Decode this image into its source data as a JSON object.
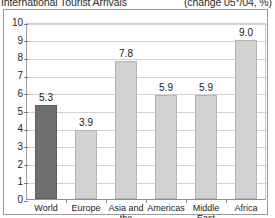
{
  "header": {
    "title": "International Tourist Arrivals",
    "subtitle": "(change 05*/04, %)"
  },
  "colors": {
    "highlight_bar": "#6f6f6f",
    "bar": "#d2d2d2",
    "bar_border": "#b4b4b4",
    "grid": "#d2d2d2",
    "axis": "#8f8f8f",
    "text": "#1a1a1a",
    "frame": "#9a9a9a",
    "background": "#ffffff"
  },
  "chart_data": {
    "type": "bar",
    "title": "International Tourist Arrivals",
    "subtitle": "(change 05*/04, %)",
    "xlabel": "",
    "ylabel": "",
    "ylim": [
      0,
      10
    ],
    "yticks": [
      0,
      1,
      2,
      3,
      4,
      5,
      6,
      7,
      8,
      9,
      10
    ],
    "ytick_labels": [
      "0",
      "1",
      "2",
      "3",
      "4",
      "5",
      "6",
      "7",
      "8",
      "9",
      "10"
    ],
    "grid": true,
    "legend": false,
    "legend_position": "none",
    "categories": [
      "World",
      "Europe",
      "Asia and the Pacific",
      "Americas",
      "Middle East",
      "Africa"
    ],
    "values": [
      5.3,
      3.9,
      7.8,
      5.9,
      5.9,
      9.0
    ],
    "value_labels": [
      "5.3",
      "3.9",
      "7.8",
      "5.9",
      "5.9",
      "9.0"
    ],
    "highlighted_index": 0,
    "bar_colors": [
      "#6f6f6f",
      "#d2d2d2",
      "#d2d2d2",
      "#d2d2d2",
      "#d2d2d2",
      "#d2d2d2"
    ]
  }
}
